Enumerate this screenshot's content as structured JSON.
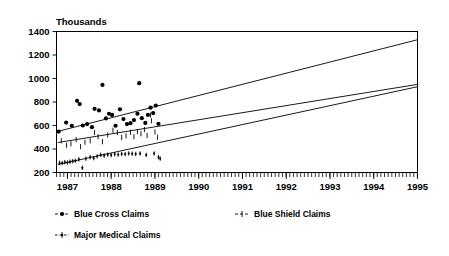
{
  "chart_data": {
    "type": "scatter",
    "title": "",
    "ylabel": "Thousands",
    "xlabel": "",
    "ylim": [
      200,
      1400
    ],
    "ytick_labels": [
      "200",
      "400",
      "600",
      "800",
      "1000",
      "1200",
      "1400"
    ],
    "ytick_values": [
      200,
      400,
      600,
      800,
      1000,
      1200,
      1400
    ],
    "xlim": [
      1986.75,
      1995.0
    ],
    "xtick_labels": [
      "1987",
      "1988",
      "1989",
      "1990",
      "1991",
      "1992",
      "1993",
      "1994",
      "1995"
    ],
    "xtick_values": [
      1987,
      1988,
      1989,
      1990,
      1991,
      1992,
      1993,
      1994,
      1995
    ],
    "minor_tick_interval": 0.0833,
    "grid": false,
    "legend_position": "below",
    "series": [
      {
        "name": "Blue Cross Claims",
        "marker": "filled-circle",
        "trendline": {
          "x0": 1986.78,
          "y0": 550,
          "x1": 1995.0,
          "y1": 1330
        },
        "points": [
          {
            "x": 1986.8,
            "y": 548
          },
          {
            "x": 1986.97,
            "y": 625
          },
          {
            "x": 1987.1,
            "y": 598
          },
          {
            "x": 1987.22,
            "y": 810
          },
          {
            "x": 1987.28,
            "y": 782
          },
          {
            "x": 1987.35,
            "y": 600
          },
          {
            "x": 1987.45,
            "y": 612
          },
          {
            "x": 1987.56,
            "y": 586
          },
          {
            "x": 1987.62,
            "y": 742
          },
          {
            "x": 1987.72,
            "y": 728
          },
          {
            "x": 1987.8,
            "y": 945
          },
          {
            "x": 1987.88,
            "y": 660
          },
          {
            "x": 1987.95,
            "y": 700
          },
          {
            "x": 1988.02,
            "y": 690
          },
          {
            "x": 1988.1,
            "y": 598
          },
          {
            "x": 1988.2,
            "y": 738
          },
          {
            "x": 1988.28,
            "y": 655
          },
          {
            "x": 1988.36,
            "y": 612
          },
          {
            "x": 1988.44,
            "y": 620
          },
          {
            "x": 1988.52,
            "y": 646
          },
          {
            "x": 1988.6,
            "y": 700
          },
          {
            "x": 1988.64,
            "y": 960
          },
          {
            "x": 1988.7,
            "y": 662
          },
          {
            "x": 1988.78,
            "y": 622
          },
          {
            "x": 1988.84,
            "y": 690
          },
          {
            "x": 1988.9,
            "y": 752
          },
          {
            "x": 1988.96,
            "y": 706
          },
          {
            "x": 1989.02,
            "y": 770
          },
          {
            "x": 1989.08,
            "y": 614
          }
        ]
      },
      {
        "name": "Blue Shield Claims",
        "marker": "vertical-tick",
        "trendline": {
          "x0": 1986.78,
          "y0": 455,
          "x1": 1995.0,
          "y1": 950
        },
        "points": [
          {
            "x": 1986.86,
            "y": 470
          },
          {
            "x": 1986.98,
            "y": 432
          },
          {
            "x": 1987.08,
            "y": 445
          },
          {
            "x": 1987.2,
            "y": 480
          },
          {
            "x": 1987.3,
            "y": 420
          },
          {
            "x": 1987.4,
            "y": 458
          },
          {
            "x": 1987.52,
            "y": 470
          },
          {
            "x": 1987.62,
            "y": 540
          },
          {
            "x": 1987.7,
            "y": 505
          },
          {
            "x": 1987.8,
            "y": 462
          },
          {
            "x": 1987.92,
            "y": 520
          },
          {
            "x": 1988.04,
            "y": 560
          },
          {
            "x": 1988.14,
            "y": 540
          },
          {
            "x": 1988.24,
            "y": 498
          },
          {
            "x": 1988.34,
            "y": 512
          },
          {
            "x": 1988.44,
            "y": 542
          },
          {
            "x": 1988.52,
            "y": 505
          },
          {
            "x": 1988.6,
            "y": 548
          },
          {
            "x": 1988.68,
            "y": 530
          },
          {
            "x": 1988.76,
            "y": 566
          },
          {
            "x": 1988.82,
            "y": 515
          },
          {
            "x": 1988.9,
            "y": 690
          },
          {
            "x": 1988.92,
            "y": 640
          },
          {
            "x": 1989.0,
            "y": 545
          },
          {
            "x": 1989.06,
            "y": 500
          }
        ]
      },
      {
        "name": "Major Medical Claims",
        "marker": "dashed-cross",
        "trendline": {
          "x0": 1986.78,
          "y0": 268,
          "x1": 1995.0,
          "y1": 930
        },
        "points": [
          {
            "x": 1986.82,
            "y": 282
          },
          {
            "x": 1986.88,
            "y": 280
          },
          {
            "x": 1986.94,
            "y": 288
          },
          {
            "x": 1987.0,
            "y": 285
          },
          {
            "x": 1987.06,
            "y": 292
          },
          {
            "x": 1987.12,
            "y": 296
          },
          {
            "x": 1987.18,
            "y": 300
          },
          {
            "x": 1987.26,
            "y": 312
          },
          {
            "x": 1987.34,
            "y": 240
          },
          {
            "x": 1987.42,
            "y": 318
          },
          {
            "x": 1987.52,
            "y": 330
          },
          {
            "x": 1987.6,
            "y": 322
          },
          {
            "x": 1987.68,
            "y": 338
          },
          {
            "x": 1987.76,
            "y": 350
          },
          {
            "x": 1987.84,
            "y": 344
          },
          {
            "x": 1987.92,
            "y": 352
          },
          {
            "x": 1988.0,
            "y": 348
          },
          {
            "x": 1988.08,
            "y": 356
          },
          {
            "x": 1988.16,
            "y": 352
          },
          {
            "x": 1988.24,
            "y": 358
          },
          {
            "x": 1988.32,
            "y": 356
          },
          {
            "x": 1988.4,
            "y": 362
          },
          {
            "x": 1988.48,
            "y": 360
          },
          {
            "x": 1988.56,
            "y": 358
          },
          {
            "x": 1988.66,
            "y": 362
          },
          {
            "x": 1988.8,
            "y": 350
          },
          {
            "x": 1988.98,
            "y": 362
          },
          {
            "x": 1989.08,
            "y": 330
          },
          {
            "x": 1989.12,
            "y": 318
          }
        ]
      }
    ]
  },
  "legend": {
    "items": [
      {
        "label": "Blue Cross Claims",
        "marker": "filled-circle"
      },
      {
        "label": "Blue Shield Claims",
        "marker": "vertical-tick"
      },
      {
        "label": "Major Medical Claims",
        "marker": "dashed-cross"
      }
    ]
  }
}
